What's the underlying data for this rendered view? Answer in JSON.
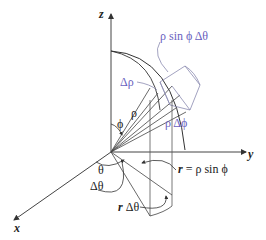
{
  "figure": {
    "colors": {
      "line": "#333333",
      "blue": "#6a5fc0",
      "box": "#8a8ab0"
    },
    "axes": {
      "z": "z",
      "y": "y",
      "x": "x"
    },
    "labels": {
      "rho_sin_phi_dtheta": "ρ sin ϕ Δθ",
      "delta_rho": "Δρ",
      "rho": "ρ",
      "rho_delta_phi": "ρ Δϕ",
      "phi": "ϕ",
      "theta": "θ",
      "delta_theta": "Δθ",
      "r_eq_prefix": "r",
      "r_eq_rest": " = ρ sin ϕ",
      "r_delta_theta_prefix": "r",
      "r_delta_theta_rest": " Δθ"
    }
  }
}
